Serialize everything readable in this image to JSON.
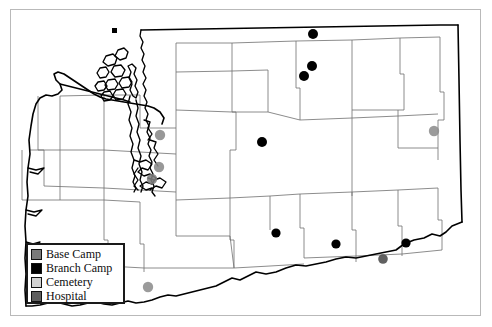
{
  "map": {
    "title": "Washington State county map with facility locations",
    "region": "Washington",
    "frame_color": "#b9b9b9",
    "background_color": "#ffffff",
    "state_outline_color": "#000000",
    "county_border_color": "#6f6f6f"
  },
  "legend": {
    "border_color": "#1a1a1a",
    "background_color": "#ffffff",
    "items": [
      {
        "label": "Base Camp",
        "color": "#7a7a7a"
      },
      {
        "label": "Branch Camp",
        "color": "#000000"
      },
      {
        "label": "Cemetery",
        "color": "#d2d2d2"
      },
      {
        "label": "Hospital",
        "color": "#5e5e5e"
      }
    ]
  },
  "markers": [
    {
      "name": "marker-branch-camp-north-1",
      "type": "Branch Camp",
      "color": "#000000",
      "x": 313,
      "y": 34,
      "r": 5.0
    },
    {
      "name": "marker-branch-camp-north-2",
      "type": "Branch Camp",
      "color": "#000000",
      "x": 312,
      "y": 66,
      "r": 5.0
    },
    {
      "name": "marker-branch-camp-north-3",
      "type": "Branch Camp",
      "color": "#000000",
      "x": 304,
      "y": 76,
      "r": 5.0
    },
    {
      "name": "marker-branch-camp-central",
      "type": "Branch Camp",
      "color": "#000000",
      "x": 262,
      "y": 142,
      "r": 5.0
    },
    {
      "name": "marker-branch-camp-south-1",
      "type": "Branch Camp",
      "color": "#000000",
      "x": 276,
      "y": 233,
      "r": 4.6
    },
    {
      "name": "marker-branch-camp-south-2",
      "type": "Branch Camp",
      "color": "#000000",
      "x": 336,
      "y": 244,
      "r": 4.6
    },
    {
      "name": "marker-branch-camp-southeast",
      "type": "Branch Camp",
      "color": "#000000",
      "x": 406,
      "y": 243,
      "r": 4.6
    },
    {
      "name": "marker-hospital-southeast",
      "type": "Hospital",
      "color": "#4a4a4a",
      "x": 383,
      "y": 259,
      "r": 4.8
    },
    {
      "name": "marker-base-camp-puget-1",
      "type": "Base Camp",
      "color": "#8a8a8a",
      "x": 160,
      "y": 135,
      "r": 5.2
    },
    {
      "name": "marker-base-camp-puget-2",
      "type": "Base Camp",
      "color": "#8a8a8a",
      "x": 159,
      "y": 167,
      "r": 5.2
    },
    {
      "name": "marker-hospital-puget",
      "type": "Hospital",
      "color": "#7e7e7e",
      "x": 152,
      "y": 179,
      "r": 5.2
    },
    {
      "name": "marker-base-camp-east",
      "type": "Base Camp",
      "color": "#8d8d8d",
      "x": 434,
      "y": 131,
      "r": 5.2
    },
    {
      "name": "marker-base-camp-southwest",
      "type": "Base Camp",
      "color": "#8d8d8d",
      "x": 148,
      "y": 287,
      "r": 5.2
    }
  ]
}
